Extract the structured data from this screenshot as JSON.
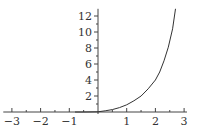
{
  "chart_data": {
    "type": "line",
    "title": "",
    "xlabel": "",
    "ylabel": "",
    "xlim": [
      -3.3,
      3.1
    ],
    "ylim": [
      0,
      12.9
    ],
    "grid": false,
    "x_ticks": [
      -3,
      -2,
      -1,
      1,
      2,
      3
    ],
    "x_tick_labels": [
      "−3",
      "−2",
      "−1",
      "1",
      "2",
      "3"
    ],
    "y_ticks": [
      2,
      4,
      6,
      8,
      10,
      12
    ],
    "y_tick_labels": [
      "2",
      "4",
      "6",
      "8",
      "10",
      "12"
    ],
    "series": [
      {
        "name": "curve",
        "color": "#333333",
        "x": [
          -0.8,
          -0.5,
          0,
          0.25,
          0.5,
          0.75,
          1.0,
          1.25,
          1.5,
          1.75,
          2.0,
          2.15,
          2.3,
          2.45,
          2.6,
          2.7
        ],
        "y": [
          0,
          0,
          0.03,
          0.15,
          0.3,
          0.55,
          0.9,
          1.4,
          2.0,
          2.9,
          4.0,
          5.0,
          6.4,
          8.1,
          10.4,
          12.9
        ]
      }
    ]
  },
  "layout": {
    "origin_px": [
      98,
      112
    ],
    "px_per_x": 28.7,
    "px_per_y": 8.0
  }
}
